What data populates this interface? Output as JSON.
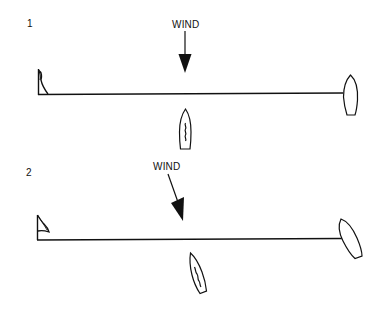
{
  "diagram": {
    "colors": {
      "ink": "#111111",
      "background": "#ffffff"
    },
    "panels": [
      {
        "number": "1",
        "wind_label": "WIND",
        "wind_direction": "straight down (perpendicular to start line)",
        "elements": [
          "pin-end-flag",
          "start-line",
          "committee-boat",
          "sailboat-below-line",
          "wind-arrow"
        ]
      },
      {
        "number": "2",
        "wind_label": "WIND",
        "wind_direction": "angled from upper-left (oblique to start line)",
        "elements": [
          "pin-end-flag",
          "start-line",
          "committee-boat-rotated",
          "sailboat-below-line-rotated",
          "wind-arrow-angled"
        ]
      }
    ]
  }
}
